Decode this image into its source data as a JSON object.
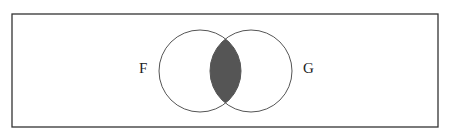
{
  "diagram": {
    "type": "venn",
    "sets": [
      {
        "label": "F",
        "cx": 200,
        "cy": 71,
        "r": 41
      },
      {
        "label": "G",
        "cx": 251,
        "cy": 71,
        "r": 41
      }
    ],
    "shaded_region": "F ∩ G",
    "colors": {
      "border": "#333333",
      "circle": "#555555",
      "shade": "#555555",
      "background": "#ffffff"
    }
  }
}
